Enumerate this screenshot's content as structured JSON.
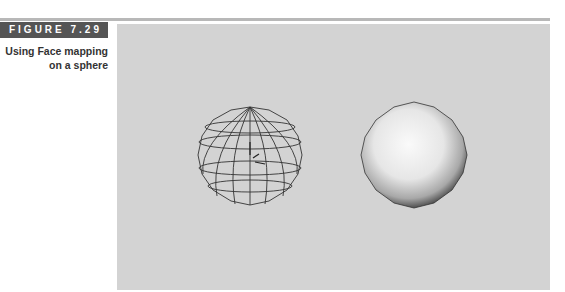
{
  "figure": {
    "label": "FIGURE 7.29",
    "caption": "Using Face mapping on a sphere"
  },
  "viewport": {
    "background": "#d3d3d3",
    "objects": [
      {
        "name": "wireframe-sphere",
        "type": "wireframe"
      },
      {
        "name": "shaded-sphere",
        "type": "shaded"
      }
    ]
  }
}
